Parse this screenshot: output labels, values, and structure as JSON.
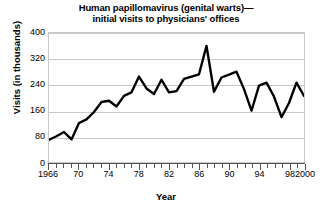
{
  "figure": {
    "title_lines": [
      "Human papillomavirus (genital warts)—",
      "initial visits to physicians' offices"
    ],
    "y_axis_title": "Visits (in thousands)",
    "x_axis_title": "Year"
  },
  "chart_data": {
    "type": "line",
    "xlabel": "Year",
    "ylabel": "Visits (in thousands)",
    "xlim": [
      1966,
      2000
    ],
    "ylim": [
      0,
      400
    ],
    "grid": true,
    "legend": "none",
    "y_ticks": [
      0,
      80,
      160,
      240,
      320,
      400
    ],
    "y_tick_labels": [
      "0",
      "80",
      "160",
      "240",
      "320",
      "400"
    ],
    "x_ticks": [
      1966,
      1970,
      1974,
      1978,
      1982,
      1986,
      1990,
      1994,
      1998,
      2000
    ],
    "x_tick_labels": [
      "1966",
      "70",
      "74",
      "78",
      "82",
      "86",
      "90",
      "94",
      "98",
      "2000"
    ],
    "x_minor_tick_interval": 1,
    "line_color": "#000000",
    "line_width": 2.4,
    "x": [
      1966,
      1967,
      1968,
      1969,
      1970,
      1971,
      1972,
      1973,
      1974,
      1975,
      1976,
      1977,
      1978,
      1979,
      1980,
      1981,
      1982,
      1983,
      1984,
      1985,
      1986,
      1987,
      1988,
      1989,
      1990,
      1991,
      1992,
      1993,
      1994,
      1995,
      1996,
      1997,
      1998,
      1999,
      2000
    ],
    "values": [
      69,
      80,
      93,
      70,
      121,
      132,
      155,
      186,
      190,
      172,
      205,
      216,
      265,
      228,
      211,
      255,
      216,
      220,
      258,
      265,
      272,
      360,
      218,
      262,
      271,
      280,
      226,
      159,
      237,
      246,
      203,
      139,
      183,
      246,
      205
    ],
    "series": [
      {
        "name": "Initial visits to physicians' offices",
        "values": [
          69,
          80,
          93,
          70,
          121,
          132,
          155,
          186,
          190,
          172,
          205,
          216,
          265,
          228,
          211,
          255,
          216,
          220,
          258,
          265,
          272,
          360,
          218,
          262,
          271,
          280,
          226,
          159,
          237,
          246,
          203,
          139,
          183,
          246,
          205
        ]
      }
    ],
    "peak": {
      "year": 1987,
      "value": 360
    },
    "minimum": {
      "year": 1966,
      "value": 69
    }
  }
}
